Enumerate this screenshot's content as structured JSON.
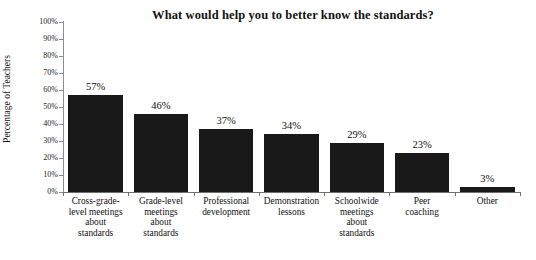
{
  "chart_data": {
    "type": "bar",
    "title": "What would help you to better know the standards?",
    "xlabel": "",
    "ylabel": "Percentage of Teachers",
    "ylim": [
      0,
      100
    ],
    "ytick_labels": [
      "0%",
      "10%",
      "20%",
      "30%",
      "40%",
      "50%",
      "60%",
      "70%",
      "80%",
      "90%",
      "100%"
    ],
    "ytick_values": [
      0,
      10,
      20,
      30,
      40,
      50,
      60,
      70,
      80,
      90,
      100
    ],
    "grid": false,
    "legend": "none",
    "bar_color": "#191919",
    "categories": [
      "Cross-grade-level meetings about standards",
      "Grade-level meetings about standards",
      "Professional development",
      "Demonstration lessons",
      "Schoolwide meetings about standards",
      "Peer coaching",
      "Other"
    ],
    "category_lines": [
      [
        "Cross-grade-",
        "level meetings",
        "about",
        "standards"
      ],
      [
        "Grade-level",
        "meetings",
        "about",
        "standards"
      ],
      [
        "Professional",
        "development"
      ],
      [
        "Demonstration",
        "lessons"
      ],
      [
        "Schoolwide",
        "meetings",
        "about",
        "standards"
      ],
      [
        "Peer",
        "coaching"
      ],
      [
        "Other"
      ]
    ],
    "values": [
      57,
      46,
      37,
      34,
      29,
      23,
      3
    ],
    "data_labels": [
      "57%",
      "46%",
      "37%",
      "34%",
      "29%",
      "23%",
      "3%"
    ]
  }
}
